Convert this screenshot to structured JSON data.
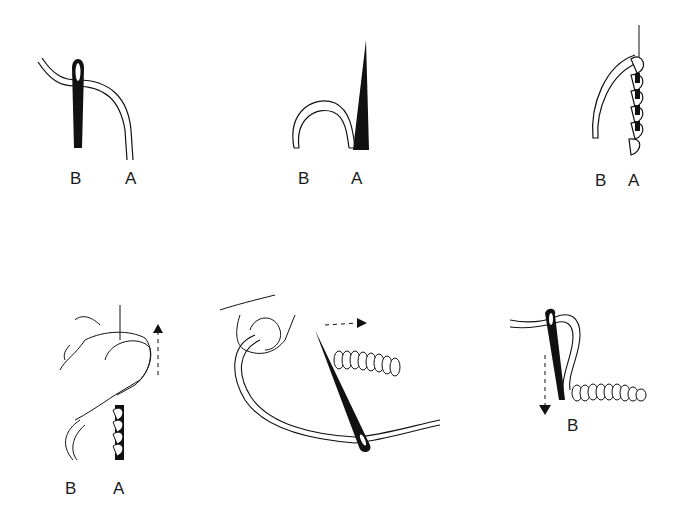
{
  "diagram": {
    "title": "",
    "steps": [
      {
        "id": 1,
        "labels": [
          "B",
          "A"
        ],
        "description": "needle inserted at B, thread emerging toward A"
      },
      {
        "id": 2,
        "labels": [
          "B",
          "A"
        ],
        "description": "thread looped from B, needle point emerging at A"
      },
      {
        "id": 3,
        "labels": [
          "B",
          "A"
        ],
        "description": "thread wrapped around needle at A"
      },
      {
        "id": 4,
        "labels": [
          "B",
          "A"
        ],
        "description": "thumb holding wraps, arrow up",
        "arrow": "up"
      },
      {
        "id": 5,
        "labels": [],
        "description": "needle pulled through coiled wraps, arrow right",
        "arrow": "right"
      },
      {
        "id": 6,
        "labels": [
          "B"
        ],
        "description": "needle inserted back at B to finish bullion knot, arrow down",
        "arrow": "down"
      }
    ],
    "colors": {
      "ink": "#111111",
      "background": "#ffffff"
    }
  }
}
